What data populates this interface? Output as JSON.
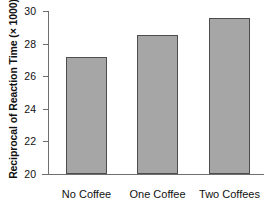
{
  "chart_data": {
    "type": "bar",
    "title": "",
    "subtitle": "",
    "xlabel": "",
    "ylabel": "Reciprocal of Reaction Time (× 1000)",
    "categories": [
      "No Coffee",
      "One Coffee",
      "Two Coffees"
    ],
    "values": [
      27.2,
      28.5,
      29.6
    ],
    "ylim": [
      20,
      30
    ],
    "yticks": [
      20,
      22,
      24,
      26,
      28,
      30
    ],
    "ytick_labels": [
      "20",
      "22",
      "24",
      "26",
      "28",
      "30"
    ],
    "grid": false,
    "legend": false,
    "legend_position": "none",
    "annotations": [],
    "series": [
      {
        "name": "Reciprocal of Reaction Time",
        "values": [
          27.2,
          28.5,
          29.6
        ]
      }
    ],
    "colors": {
      "bar_fill": "#a6a6a6",
      "bar_edge": "#4d4d4d",
      "axis": "#6f6f6f",
      "text": "#111111",
      "background": "#ffffff"
    }
  },
  "axes": {
    "y_title": "Reciprocal of Reaction Time (× 1000)",
    "tick_30": "30",
    "tick_28": "28",
    "tick_26": "26",
    "tick_24": "24",
    "tick_22": "22",
    "tick_20": "20"
  },
  "bars": {
    "label_0": "No Coffee",
    "label_1": "One Coffee",
    "label_2": "Two Coffees"
  }
}
